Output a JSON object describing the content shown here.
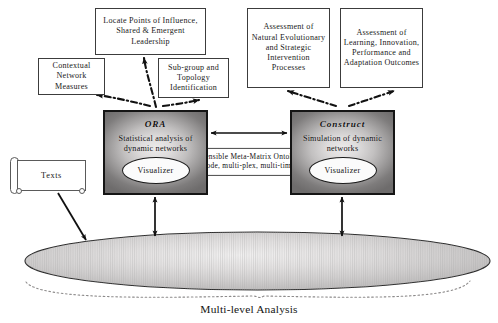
{
  "diagram": {
    "caption": "Multi-level Analysis",
    "concept_boxes": [
      {
        "id": "locate",
        "label": "Locate Points of Influence, Shared & Emergent Leadership"
      },
      {
        "id": "context",
        "label": "Contextual Network Measures"
      },
      {
        "id": "subgroup",
        "label": "Sub-group and Topology Identification"
      },
      {
        "id": "natural",
        "label": "Assessment of Natural Evolutionary and Strategic Intervention Processes"
      },
      {
        "id": "learning",
        "label": "Assessment of Learning, Innovation, Performance and Adaptation Outcomes"
      }
    ],
    "tools": [
      {
        "id": "ora",
        "title": "ORA",
        "description": "Statistical analysis of dynamic networks",
        "visualizer_label": "Visualizer"
      },
      {
        "id": "construct",
        "title": "Construct",
        "description": "Simulation of dynamic networks",
        "visualizer_label": "Visualizer"
      }
    ],
    "source": {
      "id": "texts",
      "label": "Texts"
    },
    "ontology": {
      "line1": "Extensible Meta-Matrix Ontology",
      "line2": "(multi-mode, multi-plex, multi-time period)"
    },
    "colors": {
      "outline": "#3c3c3c",
      "tool_border": "#151515",
      "tool_fill_center": "#eceaea",
      "tool_fill_edge": "#6e6c6c",
      "ellipse_fill": "#d8d6d6",
      "arrow": "#101010",
      "brace": "#8a8a8a",
      "background": "#ffffff"
    }
  }
}
